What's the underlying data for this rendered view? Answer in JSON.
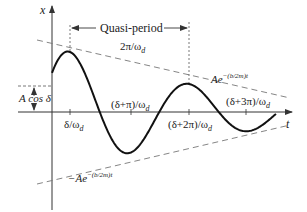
{
  "diagram": {
    "axes": {
      "vertical_label": "x",
      "horizontal_label": "t"
    },
    "labels": {
      "quasi_period_title": "Quasi-period",
      "quasi_period_value": "2π/ω",
      "quasi_period_sub": "d",
      "initial_value": "A cos δ",
      "upper_envelope_base": "Ae",
      "upper_envelope_exp": "−(b/2m)t",
      "lower_envelope_base": "−Ae",
      "lower_envelope_exp": "−(b/2m)t",
      "tick_1": "δ/ω",
      "tick_2": "(δ+π)/ω",
      "tick_3": "(δ+2π)/ω",
      "tick_4": "(δ+3π)/ω",
      "tick_sub": "d"
    },
    "colors": {
      "curve": "#111111",
      "axes": "#333333",
      "dashed": "#777777",
      "text": "#222222"
    }
  }
}
